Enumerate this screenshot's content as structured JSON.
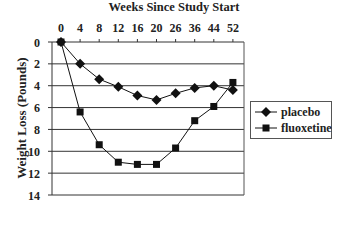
{
  "chart_data": {
    "type": "line",
    "title": "Weeks Since Study Start",
    "xlabel": "Weeks Since Study Start",
    "ylabel": "Weight Loss (Pounds)",
    "categories": [
      "0",
      "4",
      "8",
      "12",
      "16",
      "20",
      "26",
      "36",
      "44",
      "52"
    ],
    "y_ticks": [
      "0",
      "2",
      "4",
      "6",
      "8",
      "10",
      "12",
      "14"
    ],
    "ylim": [
      0,
      14
    ],
    "y_inverted": true,
    "x_axis_position": "top",
    "grid": {
      "horizontal": true,
      "vertical": false
    },
    "legend_position": "right",
    "series": [
      {
        "name": "placebo",
        "marker": "diamond",
        "color": "#111111",
        "values": [
          0,
          2.0,
          3.4,
          4.1,
          4.9,
          5.3,
          4.7,
          4.2,
          4.0,
          4.4
        ]
      },
      {
        "name": "fluoxetine",
        "marker": "square",
        "color": "#111111",
        "values": [
          0,
          6.4,
          9.4,
          11.0,
          11.2,
          11.2,
          9.7,
          7.2,
          5.9,
          3.7
        ]
      }
    ]
  },
  "legend": {
    "items": [
      "placebo",
      "fluoxetine"
    ]
  }
}
